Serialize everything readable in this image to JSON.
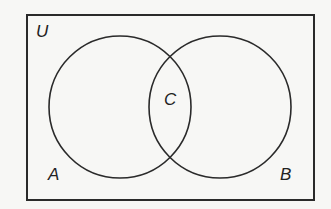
{
  "diagram": {
    "type": "venn",
    "universe_label": "U",
    "sets": [
      {
        "name": "A",
        "label": "A"
      },
      {
        "name": "B",
        "label": "B"
      }
    ],
    "intersection_label": "C",
    "stroke_color": "#2a2a2a",
    "background_color": "#f7f7f5"
  }
}
